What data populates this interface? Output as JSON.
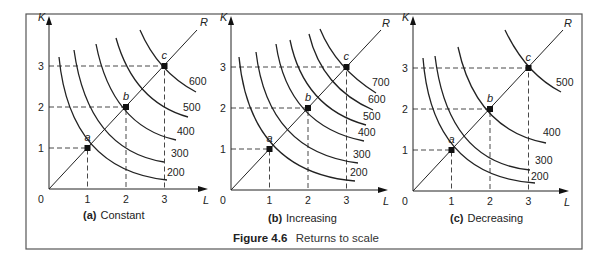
{
  "figure": {
    "caption_label": "Figure 4.6",
    "caption_text": "Returns to scale"
  },
  "chart_data": [
    {
      "type": "line",
      "title": "(a) Constant",
      "panel_letter": "(a)",
      "panel_name": "Constant",
      "xlabel": "L",
      "ylabel": "K",
      "ray_label": "R",
      "x_ticks": [
        "0",
        "1",
        "2",
        "3"
      ],
      "y_ticks": [
        "1",
        "2",
        "3"
      ],
      "points": [
        {
          "label": "a",
          "L": 1,
          "K": 1,
          "output": 200
        },
        {
          "label": "b",
          "L": 2,
          "K": 2,
          "output": 400
        },
        {
          "label": "c",
          "L": 3,
          "K": 3,
          "output": 600
        }
      ],
      "isoquants": [
        200,
        300,
        400,
        500,
        600
      ],
      "grid": false
    },
    {
      "type": "line",
      "title": "(b) Increasing",
      "panel_letter": "(b)",
      "panel_name": "Increasing",
      "xlabel": "L",
      "ylabel": "K",
      "ray_label": "R",
      "x_ticks": [
        "0",
        "1",
        "2",
        "3"
      ],
      "y_ticks": [
        "1",
        "2",
        "3"
      ],
      "points": [
        {
          "label": "a",
          "L": 1,
          "K": 1,
          "output": 200
        },
        {
          "label": "b",
          "L": 2,
          "K": 2,
          "output": 400
        },
        {
          "label": "c",
          "L": 3,
          "K": 3,
          "output": 700
        }
      ],
      "isoquants": [
        200,
        300,
        400,
        500,
        600,
        700
      ],
      "grid": false
    },
    {
      "type": "line",
      "title": "(c) Decreasing",
      "panel_letter": "(c)",
      "panel_name": "Decreasing",
      "xlabel": "L",
      "ylabel": "K",
      "ray_label": "R",
      "x_ticks": [
        "0",
        "1",
        "2",
        "3"
      ],
      "y_ticks": [
        "1",
        "2",
        "3"
      ],
      "points": [
        {
          "label": "a",
          "L": 1,
          "K": 1,
          "output": 200
        },
        {
          "label": "b",
          "L": 2,
          "K": 2,
          "output": 400
        },
        {
          "label": "c",
          "L": 3,
          "K": 3,
          "output": 500
        }
      ],
      "isoquants": [
        200,
        300,
        400,
        500
      ],
      "grid": false
    }
  ],
  "panels": [
    {
      "origin": [
        49,
        189
      ],
      "unit": [
        38.5,
        41
      ],
      "xaxis_end": 200,
      "yaxis_top": 22,
      "ray_end": [
        197,
        30
      ],
      "ray_label_pos": [
        200,
        26
      ],
      "subtitle_pos": [
        83,
        219
      ],
      "curves": [
        {
          "value": "200",
          "d": "M59,57 Q70,170 167,180",
          "lx": 167,
          "ly": 176
        },
        {
          "value": "300",
          "d": "M74,50 Q88,150 164,162",
          "lx": 171,
          "ly": 157
        },
        {
          "value": "400",
          "d": "M96,44 Q112,126 176,140",
          "lx": 177,
          "ly": 135
        },
        {
          "value": "500",
          "d": "M116,38 Q134,102 188,117",
          "lx": 183,
          "ly": 111
        },
        {
          "value": "600",
          "d": "M140,30 Q158,72 196,92",
          "lx": 189,
          "ly": 85
        }
      ]
    },
    {
      "origin": [
        231,
        190
      ],
      "unit": [
        38.5,
        41
      ],
      "xaxis_end": 380,
      "yaxis_top": 22,
      "ray_end": [
        381,
        30
      ],
      "ray_label_pos": [
        382,
        27
      ],
      "subtitle_pos": [
        268,
        222
      ],
      "curves": [
        {
          "value": "200",
          "d": "M239,57 Q250,172 355,181",
          "lx": 350,
          "ly": 176
        },
        {
          "value": "300",
          "d": "M256,52 Q268,152 358,163",
          "lx": 353,
          "ly": 158
        },
        {
          "value": "400",
          "d": "M276,44 Q288,126 364,141",
          "lx": 358,
          "ly": 136
        },
        {
          "value": "500",
          "d": "M290,40 Q304,108 366,125",
          "lx": 363,
          "ly": 120
        },
        {
          "value": "600",
          "d": "M309,34 Q322,88 373,110",
          "lx": 368,
          "ly": 103
        },
        {
          "value": "700",
          "d": "M320,29 Q336,68 376,93",
          "lx": 372,
          "ly": 86
        }
      ]
    },
    {
      "origin": [
        413,
        191
      ],
      "unit": [
        38.5,
        41
      ],
      "xaxis_end": 561,
      "yaxis_top": 22,
      "ray_end": [
        563,
        30
      ],
      "ray_label_pos": [
        564,
        27
      ],
      "subtitle_pos": [
        450,
        222
      ],
      "curves": [
        {
          "value": "200",
          "d": "M423,58 Q432,176 535,183",
          "lx": 531,
          "ly": 180
        },
        {
          "value": "300",
          "d": "M435,56 Q448,162 530,170",
          "lx": 535,
          "ly": 164
        },
        {
          "value": "400",
          "d": "M458,47 Q476,130 546,143",
          "lx": 543,
          "ly": 136
        },
        {
          "value": "500",
          "d": "M505,30 Q526,74 561,92",
          "lx": 556,
          "ly": 86
        }
      ]
    }
  ]
}
